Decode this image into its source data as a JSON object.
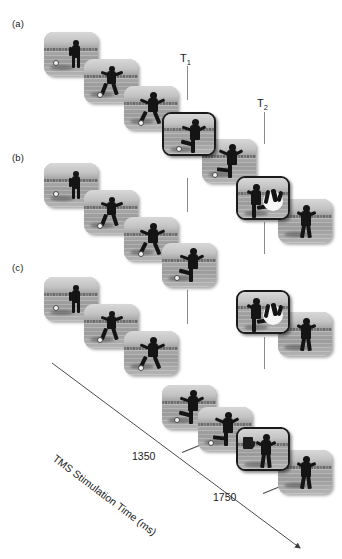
{
  "figure": {
    "panels": [
      {
        "id": "a",
        "label": "(a)",
        "x": 12,
        "y": 18
      },
      {
        "id": "b",
        "label": "(b)",
        "x": 12,
        "y": 152
      },
      {
        "id": "c",
        "label": "(c)",
        "x": 12,
        "y": 262
      }
    ],
    "time_markers": [
      {
        "name": "T1",
        "label": "T",
        "sub": "1",
        "x": 180,
        "y": 52,
        "line_x": 187
      },
      {
        "name": "T2",
        "label": "T",
        "sub": "2",
        "x": 257,
        "y": 97,
        "line_x": 264
      }
    ],
    "marker_segments": [
      {
        "marker": "T1",
        "x": 187,
        "y": 66,
        "height": 34
      },
      {
        "marker": "T1",
        "x": 187,
        "y": 178,
        "height": 34
      },
      {
        "marker": "T1",
        "x": 187,
        "y": 290,
        "height": 34
      },
      {
        "marker": "T2",
        "x": 264,
        "y": 112,
        "height": 32
      },
      {
        "marker": "T2",
        "x": 264,
        "y": 222,
        "height": 32
      },
      {
        "marker": "T2",
        "x": 264,
        "y": 337,
        "height": 32
      }
    ],
    "axis": {
      "title": "TMS Stimulation Time (ms)",
      "title_x": 58,
      "title_y": 452,
      "rotation_deg": 37,
      "line": {
        "x1": 52,
        "y1": 363,
        "x2": 300,
        "y2": 548
      },
      "ticks": [
        {
          "value": "1350",
          "label_x": 132,
          "label_y": 450,
          "dash_x": 182,
          "dash_y": 452
        },
        {
          "value": "1750",
          "label_x": 213,
          "label_y": 491,
          "dash_x": 263,
          "dash_y": 493
        }
      ]
    },
    "sequences": [
      {
        "panel": "a",
        "frames": [
          {
            "kind": "run-far",
            "x": 44,
            "y": 32,
            "highlight": false
          },
          {
            "kind": "run-mid",
            "x": 84,
            "y": 59,
            "highlight": false
          },
          {
            "kind": "run-near",
            "x": 124,
            "y": 86,
            "highlight": false
          },
          {
            "kind": "run-plant",
            "x": 162,
            "y": 112,
            "highlight": true
          },
          {
            "kind": "run-kick",
            "x": 202,
            "y": 139,
            "highlight": false
          }
        ]
      },
      {
        "panel": "b",
        "frames": [
          {
            "kind": "run-far",
            "x": 44,
            "y": 163,
            "highlight": false
          },
          {
            "kind": "run-mid",
            "x": 84,
            "y": 190,
            "highlight": false
          },
          {
            "kind": "run-near",
            "x": 124,
            "y": 217,
            "highlight": false
          },
          {
            "kind": "run-plant",
            "x": 162,
            "y": 243,
            "highlight": false
          },
          {
            "kind": "burst",
            "x": 236,
            "y": 176,
            "highlight": true
          },
          {
            "kind": "follow",
            "x": 278,
            "y": 199,
            "highlight": false
          }
        ]
      },
      {
        "panel": "c",
        "frames": [
          {
            "kind": "run-far",
            "x": 44,
            "y": 277,
            "highlight": false
          },
          {
            "kind": "run-mid",
            "x": 84,
            "y": 304,
            "highlight": false
          },
          {
            "kind": "run-near",
            "x": 124,
            "y": 331,
            "highlight": false
          },
          {
            "kind": "run-plant",
            "x": 162,
            "y": 385,
            "highlight": false
          },
          {
            "kind": "run-kick",
            "x": 198,
            "y": 407,
            "highlight": false
          },
          {
            "kind": "burst",
            "x": 236,
            "y": 290,
            "highlight": true
          },
          {
            "kind": "follow",
            "x": 278,
            "y": 312,
            "highlight": false
          },
          {
            "kind": "occluded",
            "x": 236,
            "y": 427,
            "highlight": true
          },
          {
            "kind": "follow",
            "x": 278,
            "y": 450,
            "highlight": false
          }
        ]
      }
    ]
  },
  "colors": {
    "silhouette": "#141414",
    "frame_border": "#1b1b1b",
    "marker_line": "#8a8a8a",
    "axis_line": "#4a4a4a",
    "text": "#1a1a1a"
  }
}
